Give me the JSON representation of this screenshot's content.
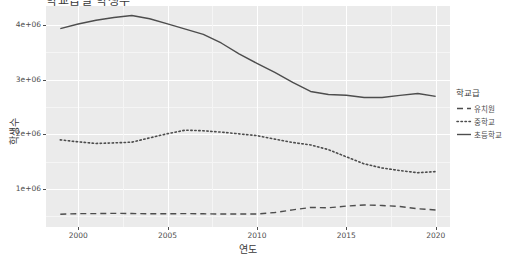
{
  "chart_data": {
    "type": "line",
    "title": "학교급별 학생수",
    "xlabel": "연도",
    "ylabel": "학생수",
    "xlim": [
      1998.2,
      2020.8
    ],
    "ylim": [
      300000,
      4350000
    ],
    "grid": true,
    "legend_position": "right",
    "legend_title": "학교급",
    "x_ticks": [
      {
        "value": 2000,
        "label": "2000"
      },
      {
        "value": 2005,
        "label": "2005"
      },
      {
        "value": 2010,
        "label": "2010"
      },
      {
        "value": 2015,
        "label": "2015"
      },
      {
        "value": 2020,
        "label": "2020"
      }
    ],
    "y_ticks": [
      {
        "value": 1000000,
        "label": "1e+06"
      },
      {
        "value": 2000000,
        "label": "2e+06"
      },
      {
        "value": 3000000,
        "label": "3e+06"
      },
      {
        "value": 4000000,
        "label": "4e+06"
      }
    ],
    "x": [
      1999,
      2000,
      2001,
      2002,
      2003,
      2004,
      2005,
      2006,
      2007,
      2008,
      2009,
      2010,
      2011,
      2012,
      2013,
      2014,
      2015,
      2016,
      2017,
      2018,
      2019,
      2020
    ],
    "series": [
      {
        "name": "유치원",
        "dash": "dashed",
        "color": "#4d4d4d",
        "values": [
          534166,
          545263,
          545142,
          550256,
          546531,
          541713,
          541603,
          545812,
          541550,
          537822,
          537361,
          538587,
          564834,
          613749,
          658188,
          652546,
          682553,
          704138,
          694631,
          675998,
          633913,
          612538
        ]
      },
      {
        "name": "중학교",
        "dash": "dotted",
        "color": "#4d4d4d",
        "values": [
          1896956,
          1860539,
          1831152,
          1841030,
          1854641,
          1933543,
          2010704,
          2075311,
          2063159,
          2038611,
          2006972,
          1974798,
          1910572,
          1849094,
          1804189,
          1717911,
          1585951,
          1457490,
          1381334,
          1334288,
          1294559,
          1315846
        ]
      },
      {
        "name": "초등학교",
        "dash": "solid",
        "color": "#4d4d4d",
        "values": [
          3935537,
          4019991,
          4089429,
          4138366,
          4175726,
          4116195,
          4022801,
          3925043,
          3829998,
          3672207,
          3474395,
          3299094,
          3132477,
          2951995,
          2784000,
          2728509,
          2714610,
          2672843,
          2674227,
          2711385,
          2747219,
          2693716
        ]
      }
    ]
  }
}
